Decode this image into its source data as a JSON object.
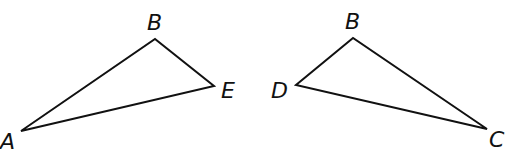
{
  "diagram": {
    "type": "geometry-triangles",
    "stroke_color": "#111111",
    "background": "#ffffff",
    "triangles": [
      {
        "name": "ABE",
        "vertices": [
          {
            "label": "A",
            "x": 21,
            "y": 131,
            "label_x": 0,
            "label_y": 149
          },
          {
            "label": "B",
            "x": 155,
            "y": 39,
            "label_x": 147,
            "label_y": 30
          },
          {
            "label": "E",
            "x": 214,
            "y": 86,
            "label_x": 221,
            "label_y": 98
          }
        ]
      },
      {
        "name": "BDC",
        "vertices": [
          {
            "label": "B",
            "x": 353,
            "y": 38,
            "label_x": 345,
            "label_y": 29
          },
          {
            "label": "D",
            "x": 296,
            "y": 85,
            "label_x": 271,
            "label_y": 98
          },
          {
            "label": "C",
            "x": 487,
            "y": 129,
            "label_x": 489,
            "label_y": 147
          }
        ]
      }
    ]
  }
}
